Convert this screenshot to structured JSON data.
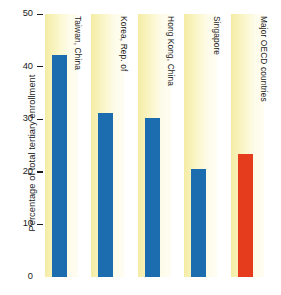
{
  "chart_data": {
    "type": "bar",
    "title": "",
    "subtitle": "",
    "xlabel": "",
    "ylabel": "Percentage of total tertiary enrollment",
    "categories": [
      "Taiwan, China",
      "Korea, Rep. of",
      "Hong Kong, China",
      "Singapore",
      "Major OECD countries"
    ],
    "values": [
      42.3,
      31.2,
      30.3,
      20.5,
      23.3
    ],
    "ylim": [
      0,
      50
    ],
    "yticks": [
      0,
      10,
      20,
      30,
      40,
      50
    ],
    "ytick_labels": [
      "0",
      "10",
      "20",
      "30",
      "40",
      "50"
    ],
    "grid": false,
    "legend": "none",
    "bar_colors": [
      "#1c6cb0",
      "#1c6cb0",
      "#1c6cb0",
      "#1c6cb0",
      "#e53c1e"
    ],
    "series": [
      {
        "name": "Percentage of total tertiary enrollment",
        "values": [
          42.3,
          31.2,
          30.3,
          20.5,
          23.3
        ]
      }
    ]
  },
  "colors": {
    "bar_blue": "#1c6cb0",
    "bar_red": "#e53c1e",
    "band_shaded": "#f4eca4",
    "band_plain": "#ffffff",
    "axis_text": "#1b1b1b",
    "page_background": "#ffffff"
  }
}
